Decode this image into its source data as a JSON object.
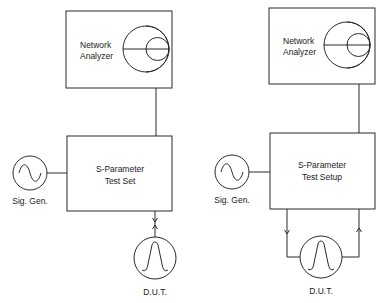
{
  "diagrams": [
    {
      "id": "left",
      "network_analyzer": {
        "line1": "Network",
        "line2": "Analyzer",
        "icon": "smith-chart-icon"
      },
      "test_unit": {
        "line1": "S-Parameter",
        "line2": "Test Set"
      },
      "signal_generator": {
        "label": "Sig. Gen.",
        "icon": "sine-wave-icon"
      },
      "dut": {
        "label": "D.U.T.",
        "icon": "bandpass-response-icon"
      },
      "connection": "single-port-bidirectional"
    },
    {
      "id": "right",
      "network_analyzer": {
        "line1": "Network",
        "line2": "Analyzer",
        "icon": "smith-chart-icon"
      },
      "test_unit": {
        "line1": "S-Parameter",
        "line2": "Test Setup"
      },
      "signal_generator": {
        "label": "Sig. Gen.",
        "icon": "sine-wave-icon"
      },
      "dut": {
        "label": "D.U.T.",
        "icon": "bandpass-response-icon"
      },
      "connection": "two-port-loop"
    }
  ],
  "colors": {
    "line": "#2a2a2a",
    "background": "#ffffff",
    "text": "#1a1a1a"
  }
}
